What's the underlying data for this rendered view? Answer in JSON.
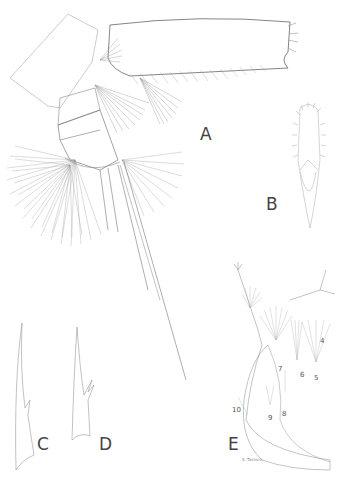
{
  "figure": {
    "panels": [
      {
        "id": "A",
        "label": "A",
        "description": "appendage, whole view"
      },
      {
        "id": "B",
        "label": "B",
        "description": "setose lobe"
      },
      {
        "id": "C",
        "label": "C",
        "description": "spine"
      },
      {
        "id": "D",
        "label": "D",
        "description": "spine with denticles"
      },
      {
        "id": "E",
        "label": "E",
        "description": "appendage with numbered setae"
      }
    ],
    "panel_E_numbers": [
      "4",
      "5",
      "6",
      "7",
      "8",
      "9",
      "10"
    ],
    "signature": "S. Tashorn",
    "colors": {
      "background": "#ffffff",
      "line": "#777777",
      "label": "#444444"
    }
  }
}
